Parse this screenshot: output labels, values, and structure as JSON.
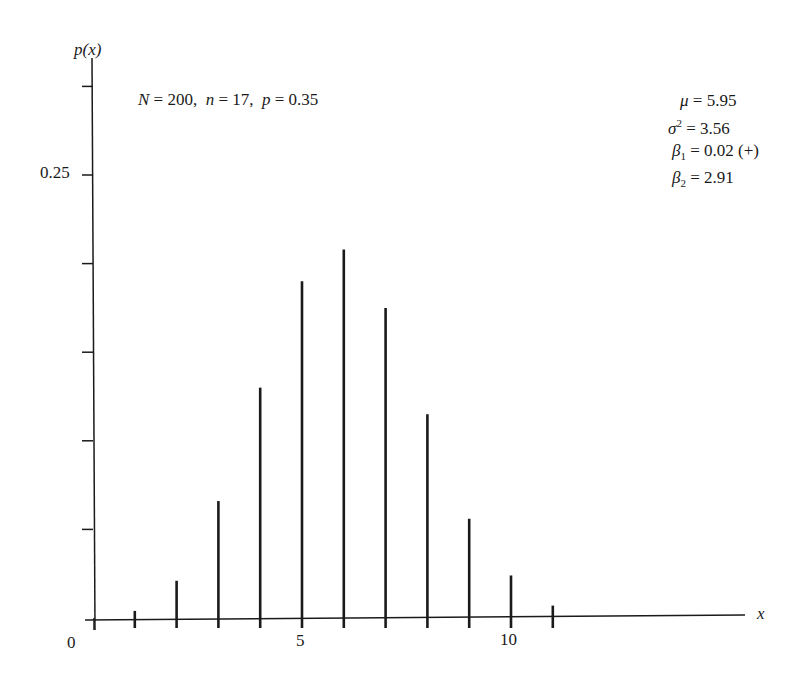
{
  "chart_data": {
    "type": "bar",
    "title": "",
    "xlabel": "x",
    "ylabel": "p(x)",
    "categories": [
      1,
      2,
      3,
      4,
      5,
      6,
      7,
      8,
      9,
      10,
      11
    ],
    "values": [
      0.004,
      0.021,
      0.066,
      0.13,
      0.19,
      0.208,
      0.175,
      0.115,
      0.056,
      0.024,
      0.007
    ],
    "ylim": [
      0,
      0.3
    ],
    "xlim": [
      0,
      15
    ],
    "x_ticks": [
      1,
      2,
      3,
      4,
      5,
      6,
      7,
      8,
      9,
      10,
      11
    ],
    "x_tick_labels": {
      "0": "0",
      "5": "5",
      "10": "10"
    },
    "y_ticks": [
      0.05,
      0.1,
      0.15,
      0.2,
      0.25,
      0.3
    ],
    "y_tick_labels": {
      "0.25": "0.25"
    },
    "grid": false,
    "style": "spike/line-bar",
    "annotations": [
      "N = 200, n = 17, p = 0.35",
      "μ = 5.95",
      "σ² = 3.56",
      "β1 = 0.02 (+)",
      "β2 = 2.91"
    ]
  },
  "labels": {
    "y_axis": "p(x)",
    "x_axis": "x",
    "origin": "0",
    "x5": "5",
    "x10": "10",
    "y025": "0.25"
  },
  "params": {
    "N_sym": "N",
    "N_val": " = 200,  ",
    "n_sym": "n",
    "n_val": " = 17,  ",
    "p_sym": "p",
    "p_val": " = 0.35"
  },
  "stats": {
    "mu_sym": "μ",
    "mu_val": " = 5.95",
    "sigma_sym": "σ",
    "sigma_sup": "2",
    "sigma_val": " = 3.56",
    "beta1_sym": "β",
    "beta1_sub": "1",
    "beta1_val": " = 0.02 (+)",
    "beta2_sym": "β",
    "beta2_sub": "2",
    "beta2_val": " = 2.91"
  },
  "colors": {
    "ink": "#1a1a1a",
    "background": "#ffffff"
  }
}
